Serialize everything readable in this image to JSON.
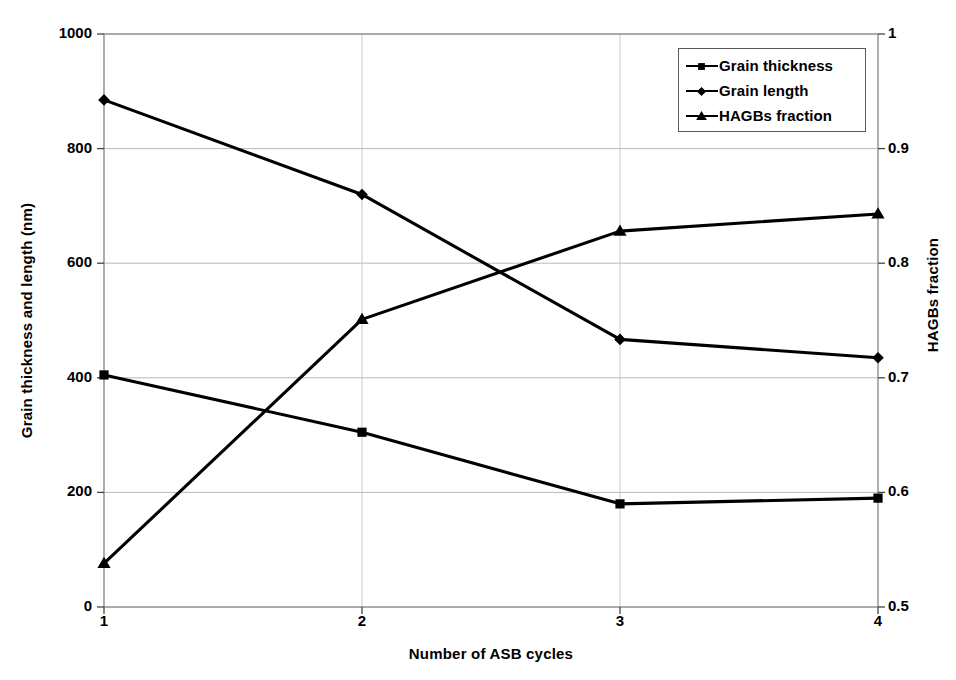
{
  "chart_data": {
    "type": "line",
    "title": "",
    "xlabel": "Number of ASB cycles",
    "ylabel": "Grain thickness and length (nm)",
    "y2label": "HAGBs fraction",
    "x": [
      1,
      2,
      3,
      4
    ],
    "xtick_labels": [
      "1",
      "2",
      "3",
      "4"
    ],
    "xlim": [
      1,
      4
    ],
    "ylim": [
      0,
      1000
    ],
    "ytick_labels": [
      "0",
      "200",
      "400",
      "600",
      "800",
      "1000"
    ],
    "ytick_values": [
      0,
      200,
      400,
      600,
      800,
      1000
    ],
    "y2lim": [
      0.5,
      1
    ],
    "y2tick_labels": [
      "0.5",
      "0.6",
      "0.7",
      "0.8",
      "0.9",
      "1"
    ],
    "y2tick_values": [
      0.5,
      0.6,
      0.7,
      0.8,
      0.9,
      1
    ],
    "grid": true,
    "legend_position": "top-right",
    "series": [
      {
        "name": "Grain thickness",
        "marker": "square",
        "axis": "left",
        "color": "#000000",
        "values": [
          405,
          305,
          180,
          190
        ]
      },
      {
        "name": "Grain length",
        "marker": "diamond",
        "axis": "left",
        "color": "#000000",
        "values": [
          885,
          720,
          467,
          435
        ]
      },
      {
        "name": "HAGBs fraction",
        "marker": "triangle",
        "axis": "right",
        "color": "#000000",
        "values": [
          0.538,
          0.751,
          0.828,
          0.843
        ]
      }
    ]
  },
  "legend": {
    "items": [
      {
        "label": "Grain thickness",
        "marker": "square"
      },
      {
        "label": "Grain length",
        "marker": "diamond"
      },
      {
        "label": "HAGBs fraction",
        "marker": "triangle"
      }
    ]
  },
  "axes": {
    "x_title": "Number of ASB cycles",
    "y_left_title": "Grain thickness and length (nm)",
    "y_right_title": "HAGBs fraction"
  }
}
